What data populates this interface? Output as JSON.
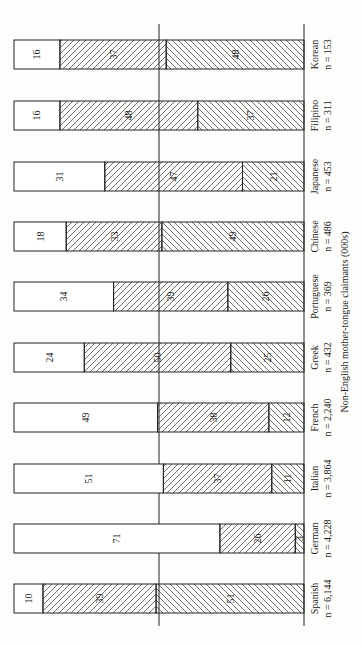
{
  "chart_data": {
    "type": "bar",
    "orientation": "horizontal-stacked (figure rotated 90°, text reads bottom-to-top)",
    "stacked": true,
    "percent": true,
    "title": "",
    "xlabel": "Non-English mother-tongue claimants (000s)",
    "ylabel": "",
    "ylim": [
      0,
      100
    ],
    "reference_line": 50,
    "legend": null,
    "categories": [
      "Spanish",
      "German",
      "Italian",
      "French",
      "Greek",
      "Portuguese",
      "Chinese",
      "Japanese",
      "Filipino",
      "Korean"
    ],
    "category_n": [
      "n = 6,144",
      "n = 4,228",
      "n = 3,864",
      "n = 2,240",
      "n = 432",
      "n = 369",
      "n = 486",
      "n = 453",
      "n = 311",
      "n = 153"
    ],
    "series": [
      {
        "name": "Segment 1 (white, outer)",
        "pattern": "none",
        "values": [
          10,
          71,
          51,
          49,
          24,
          34,
          18,
          31,
          16,
          16
        ]
      },
      {
        "name": "Segment 2 (forward-hatched)",
        "pattern": "hatch-forward",
        "values": [
          39,
          26,
          37,
          38,
          50,
          39,
          33,
          47,
          48,
          37
        ]
      },
      {
        "name": "Segment 3 (back-hatched, nearest baseline)",
        "pattern": "hatch-back",
        "values": [
          51,
          3,
          11,
          12,
          25,
          26,
          49,
          21,
          37,
          48
        ]
      }
    ]
  },
  "axis_title": "Non-English mother-tongue claimants (000s)",
  "bars": [
    {
      "name": "Korean",
      "n": "n = 153",
      "y": 40,
      "segs": [
        16,
        37,
        48
      ]
    },
    {
      "name": "Filipino",
      "n": "n = 311",
      "y": 101,
      "segs": [
        16,
        48,
        37
      ]
    },
    {
      "name": "Japanese",
      "n": "n =  453",
      "y": 162,
      "segs": [
        31,
        47,
        21
      ]
    },
    {
      "name": "Chinese",
      "n": "n = 486",
      "y": 222,
      "segs": [
        18,
        33,
        49
      ]
    },
    {
      "name": "Portuguese",
      "n": "n =  369",
      "y": 282,
      "segs": [
        34,
        39,
        26
      ]
    },
    {
      "name": "Greek",
      "n": "n = 432",
      "y": 343,
      "segs": [
        24,
        50,
        25
      ]
    },
    {
      "name": "French",
      "n": "n = 2,240",
      "y": 403,
      "segs": [
        49,
        38,
        12
      ]
    },
    {
      "name": "Italian",
      "n": "n = 3,864",
      "y": 464,
      "segs": [
        51,
        37,
        11
      ]
    },
    {
      "name": "German",
      "n": "n = 4,228",
      "y": 524,
      "segs": [
        71,
        26,
        3
      ]
    },
    {
      "name": "Spanish",
      "n": "n = 6,144",
      "y": 584,
      "segs": [
        10,
        39,
        51
      ]
    }
  ]
}
